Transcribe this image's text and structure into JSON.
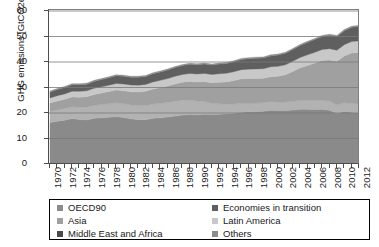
{
  "chart_data": {
    "type": "area",
    "stacked": true,
    "title": "",
    "xlabel": "",
    "ylabel": "GHG emissions [GtCO2eq]",
    "ylim": [
      0,
      60
    ],
    "yticks": [
      0,
      10,
      20,
      30,
      40,
      50,
      60
    ],
    "xlim": [
      1970,
      2012
    ],
    "grid": "horizontal",
    "legend_position": "bottom",
    "x": [
      1970,
      1971,
      1972,
      1973,
      1974,
      1975,
      1976,
      1977,
      1978,
      1979,
      1980,
      1981,
      1982,
      1983,
      1984,
      1985,
      1986,
      1987,
      1988,
      1989,
      1990,
      1991,
      1992,
      1993,
      1994,
      1995,
      1996,
      1997,
      1998,
      1999,
      2000,
      2001,
      2002,
      2003,
      2004,
      2005,
      2006,
      2007,
      2008,
      2009,
      2010,
      2011,
      2012
    ],
    "xticks": [
      1970,
      1972,
      1974,
      1976,
      1978,
      1980,
      1982,
      1984,
      1986,
      1988,
      1990,
      1992,
      1994,
      1996,
      1998,
      2000,
      2002,
      2004,
      2006,
      2008,
      2010,
      2012
    ],
    "series": [
      {
        "name": "OECD90",
        "color": "#8a8a8a",
        "values": [
          16.3,
          16.8,
          17.2,
          17.8,
          17.5,
          17.3,
          17.9,
          18.1,
          18.3,
          18.6,
          18.2,
          17.7,
          17.4,
          17.4,
          17.9,
          18.1,
          18.4,
          18.8,
          19.2,
          19.4,
          19.3,
          19.5,
          19.4,
          19.5,
          19.7,
          19.9,
          20.3,
          20.5,
          20.6,
          20.7,
          21.1,
          21.0,
          21.0,
          21.2,
          21.5,
          21.5,
          21.4,
          21.5,
          21.1,
          19.9,
          20.6,
          20.3,
          20.1
        ]
      },
      {
        "name": "Economies in transition",
        "color": "#b2b2b2",
        "values": [
          4.3,
          4.4,
          4.6,
          4.7,
          4.8,
          5.0,
          5.1,
          5.2,
          5.3,
          5.4,
          5.4,
          5.4,
          5.4,
          5.5,
          5.6,
          5.7,
          5.7,
          5.8,
          5.8,
          5.7,
          5.4,
          5.0,
          4.4,
          4.1,
          3.7,
          3.6,
          3.6,
          3.4,
          3.3,
          3.3,
          3.3,
          3.3,
          3.3,
          3.4,
          3.4,
          3.4,
          3.5,
          3.5,
          3.5,
          3.2,
          3.4,
          3.5,
          3.4
        ]
      },
      {
        "name": "Asia",
        "color": "#a0a0a0",
        "values": [
          3.3,
          3.5,
          3.6,
          3.8,
          3.9,
          4.1,
          4.3,
          4.5,
          4.8,
          5.0,
          5.1,
          5.2,
          5.4,
          5.6,
          5.9,
          6.2,
          6.5,
          6.8,
          7.1,
          7.3,
          7.5,
          7.8,
          8.1,
          8.5,
          8.8,
          9.2,
          9.5,
          9.6,
          9.6,
          9.6,
          9.8,
          10.1,
          10.7,
          11.7,
          12.8,
          13.7,
          14.7,
          15.6,
          16.2,
          17.2,
          18.4,
          19.7,
          20.3
        ]
      },
      {
        "name": "Latin America",
        "color": "#c8c8c8",
        "values": [
          2.0,
          2.1,
          2.1,
          2.2,
          2.3,
          2.3,
          2.4,
          2.5,
          2.5,
          2.6,
          2.7,
          2.7,
          2.7,
          2.7,
          2.8,
          2.8,
          2.9,
          3.0,
          3.0,
          3.1,
          3.1,
          3.2,
          3.2,
          3.3,
          3.4,
          3.5,
          3.6,
          3.7,
          3.8,
          3.8,
          3.9,
          3.9,
          3.9,
          4.0,
          4.1,
          4.2,
          4.2,
          4.3,
          4.4,
          4.3,
          4.4,
          4.5,
          4.5
        ]
      },
      {
        "name": "Middle East and Africa",
        "color": "#5f5f5f",
        "values": [
          2.3,
          2.4,
          2.5,
          2.6,
          2.6,
          2.6,
          2.7,
          2.8,
          2.9,
          3.0,
          3.0,
          3.0,
          3.1,
          3.1,
          3.2,
          3.3,
          3.4,
          3.4,
          3.5,
          3.6,
          3.6,
          3.7,
          3.7,
          3.8,
          3.8,
          3.9,
          4.0,
          4.1,
          4.2,
          4.2,
          4.3,
          4.4,
          4.5,
          4.6,
          4.7,
          4.9,
          5.0,
          5.1,
          5.3,
          5.4,
          5.5,
          5.6,
          5.7
        ]
      },
      {
        "name": "Others",
        "color": "#8c8c8c",
        "values": [
          0.4,
          0.4,
          0.4,
          0.4,
          0.4,
          0.4,
          0.4,
          0.4,
          0.4,
          0.4,
          0.4,
          0.4,
          0.4,
          0.4,
          0.4,
          0.4,
          0.4,
          0.4,
          0.4,
          0.4,
          0.4,
          0.4,
          0.4,
          0.4,
          0.4,
          0.4,
          0.4,
          0.4,
          0.4,
          0.4,
          0.4,
          0.4,
          0.4,
          0.4,
          0.4,
          0.4,
          0.4,
          0.4,
          0.4,
          0.4,
          0.4,
          0.4,
          0.4
        ]
      }
    ],
    "totals": [
      28.6,
      29.6,
      30.4,
      31.5,
      31.5,
      31.7,
      32.8,
      33.5,
      34.2,
      35.0,
      34.8,
      34.4,
      34.4,
      34.7,
      35.8,
      36.5,
      37.3,
      38.2,
      39.0,
      39.5,
      39.3,
      39.6,
      39.2,
      39.6,
      39.8,
      40.5,
      41.4,
      41.7,
      41.9,
      42.0,
      42.8,
      43.1,
      43.8,
      45.3,
      46.9,
      48.1,
      49.2,
      50.4,
      50.9,
      50.4,
      52.7,
      54.0,
      54.4
    ]
  },
  "legend": {
    "items": [
      {
        "label": "OECD90",
        "color": "#8a8a8a"
      },
      {
        "label": "Economies in transition",
        "color": "#5f5f5f"
      },
      {
        "label": "Asia",
        "color": "#a0a0a0"
      },
      {
        "label": "Latin America",
        "color": "#c8c8c8"
      },
      {
        "label": "Middle East and Africa",
        "color": "#4a4a4a"
      },
      {
        "label": "Others",
        "color": "#8c8c8c"
      }
    ]
  }
}
